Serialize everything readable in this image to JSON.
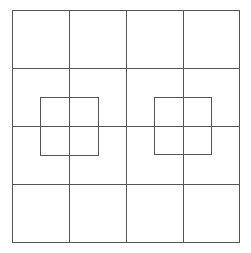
{
  "diagram": {
    "type": "grid-with-overlay-squares",
    "background": "#ffffff",
    "line_color": "#555555",
    "line_width": 1,
    "grid": {
      "rows": 4,
      "cols": 4,
      "x": 12,
      "y": 10,
      "width": 227,
      "height": 232,
      "vertical_lines_x": [
        12,
        69,
        126,
        183,
        239
      ],
      "horizontal_lines_y": [
        10,
        68,
        126,
        184,
        242
      ]
    },
    "overlay_squares": [
      {
        "name": "left-square",
        "x": 40,
        "y": 97,
        "size": 58,
        "center": [
          69,
          126
        ]
      },
      {
        "name": "right-square",
        "x": 154,
        "y": 97,
        "size": 57,
        "center": [
          183,
          126
        ]
      }
    ]
  }
}
